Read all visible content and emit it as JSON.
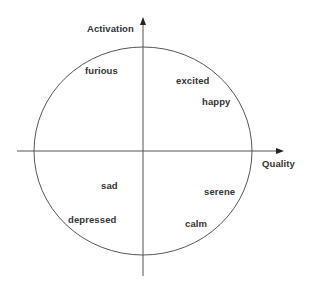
{
  "diagram": {
    "type": "circumplex",
    "colors": {
      "line": "#555555",
      "text": "#333333",
      "background": "#ffffff"
    },
    "axes": {
      "vertical": {
        "label": "Activation"
      },
      "horizontal": {
        "label": "Quality"
      }
    },
    "emotions": [
      {
        "label": "furious",
        "quadrant": "top-left"
      },
      {
        "label": "excited",
        "quadrant": "top-right"
      },
      {
        "label": "happy",
        "quadrant": "top-right"
      },
      {
        "label": "sad",
        "quadrant": "bottom-left"
      },
      {
        "label": "depressed",
        "quadrant": "bottom-left"
      },
      {
        "label": "serene",
        "quadrant": "bottom-right"
      },
      {
        "label": "calm",
        "quadrant": "bottom-right"
      }
    ]
  }
}
